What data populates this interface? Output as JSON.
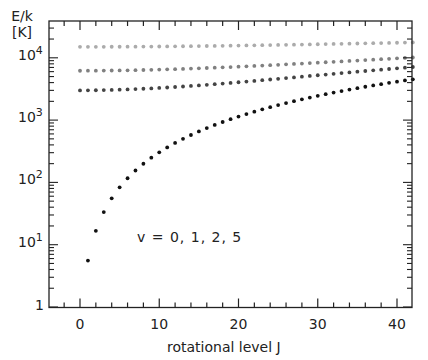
{
  "chart_data": {
    "type": "scatter",
    "title": "",
    "xlabel": "rotational level J",
    "ylabel": "E/k [K]",
    "ylabel_lines": [
      "E/k",
      "[K]"
    ],
    "xscale": "linear",
    "yscale": "log",
    "xlim": [
      -4,
      42
    ],
    "ylim": [
      1,
      30000
    ],
    "x_ticks": [
      0,
      10,
      20,
      30,
      40
    ],
    "x_tick_labels": [
      "0",
      "10",
      "20",
      "30",
      "40"
    ],
    "y_ticks": [
      1,
      10,
      100,
      1000,
      10000
    ],
    "y_tick_labels": [
      "1",
      "10",
      "10",
      "10",
      "10"
    ],
    "y_tick_exponents": [
      "",
      "1",
      "2",
      "3",
      "4"
    ],
    "grid": false,
    "annotation": "v = 0, 1, 2, 5",
    "series": [
      {
        "name": "v=0",
        "color": "#111111",
        "J_start": 1,
        "J_end": 42,
        "E0": 0,
        "B": 2.78,
        "D": 0.000155
      },
      {
        "name": "v=1",
        "color": "#444444",
        "J_start": 0,
        "J_end": 42,
        "E0": 3000,
        "B": 2.56,
        "D": 0.000155
      },
      {
        "name": "v=2",
        "color": "#808080",
        "J_start": 0,
        "J_end": 42,
        "E0": 6200,
        "B": 2.45,
        "D": 0.000155
      },
      {
        "name": "v=5",
        "color": "#ababab",
        "J_start": 0,
        "J_end": 42,
        "E0": 15000,
        "B": 1.75,
        "D": 0.000155
      }
    ],
    "sample_values": {
      "v=0": {
        "1": 5.5,
        "2": 16.5,
        "3": 33,
        "4": 55,
        "10": 300,
        "20": 1150,
        "30": 2500,
        "42": 4600
      },
      "v=1": {
        "0": 3000,
        "20": 4000,
        "42": 7300
      },
      "v=2": {
        "0": 6200,
        "20": 7200,
        "42": 10300
      },
      "v=5": {
        "0": 15000,
        "20": 15700,
        "42": 18000
      }
    }
  }
}
